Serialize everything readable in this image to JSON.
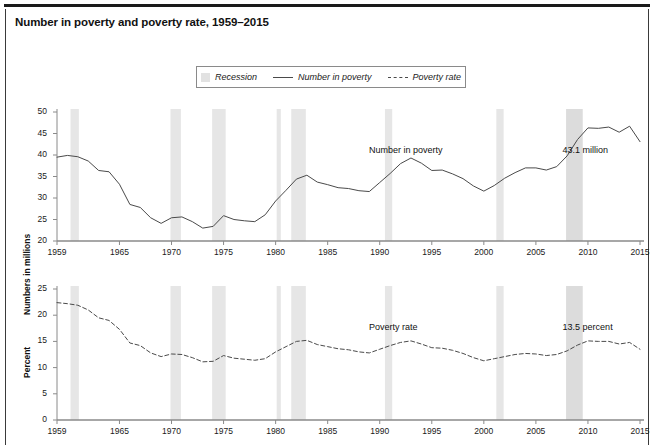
{
  "title": "Number in poverty and poverty rate, 1959–2015",
  "legend": {
    "position": "top-center",
    "items": [
      {
        "label": "Recession",
        "marker": "recession-swatch-icon"
      },
      {
        "label": "Number in poverty",
        "marker": "solid-line-icon"
      },
      {
        "label": "Poverty rate",
        "marker": "dashed-line-icon"
      }
    ]
  },
  "colors": {
    "line": "#4a4a4a",
    "recession_band": "#e6e6e6",
    "recession_band_dark": "#dcdcdc",
    "axis": "#8a8a8a",
    "text": "#111111",
    "frame": "#3a3a3a"
  },
  "recessions": [
    {
      "start": 1960.3,
      "end": 1961.1
    },
    {
      "start": 1969.9,
      "end": 1970.9
    },
    {
      "start": 1973.9,
      "end": 1975.2
    },
    {
      "start": 1980.1,
      "end": 1980.5
    },
    {
      "start": 1981.5,
      "end": 1982.9
    },
    {
      "start": 1990.5,
      "end": 1991.2
    },
    {
      "start": 2001.2,
      "end": 2001.9
    },
    {
      "start": 2007.9,
      "end": 2009.5
    }
  ],
  "chart_data": [
    {
      "type": "line",
      "id": "number-in-poverty",
      "title": "Number in poverty",
      "xlabel": "",
      "ylabel": "Numbers in millions",
      "ylim": [
        20,
        50
      ],
      "yticks": [
        20,
        25,
        30,
        35,
        40,
        45,
        50
      ],
      "xlim": [
        1959,
        2015
      ],
      "xticks": [
        1959,
        1965,
        1970,
        1975,
        1980,
        1985,
        1990,
        1995,
        2000,
        2005,
        2010,
        2015
      ],
      "grid": false,
      "linestyle": "solid",
      "annotations": [
        {
          "text": "Number in poverty",
          "x": 1993.0,
          "y": 41.0
        },
        {
          "text": "43.1 million",
          "x": 2011.6,
          "y": 41.0
        }
      ],
      "x": [
        1959,
        1960,
        1961,
        1962,
        1963,
        1964,
        1965,
        1966,
        1967,
        1968,
        1969,
        1970,
        1971,
        1972,
        1973,
        1974,
        1975,
        1976,
        1977,
        1978,
        1979,
        1980,
        1981,
        1982,
        1983,
        1984,
        1985,
        1986,
        1987,
        1988,
        1989,
        1990,
        1991,
        1992,
        1993,
        1994,
        1995,
        1996,
        1997,
        1998,
        1999,
        2000,
        2001,
        2002,
        2003,
        2004,
        2005,
        2006,
        2007,
        2008,
        2009,
        2010,
        2011,
        2012,
        2013,
        2014,
        2015
      ],
      "values": [
        39.5,
        39.9,
        39.6,
        38.6,
        36.4,
        36.1,
        33.2,
        28.5,
        27.8,
        25.4,
        24.1,
        25.4,
        25.6,
        24.5,
        23.0,
        23.4,
        25.9,
        25.0,
        24.7,
        24.5,
        26.1,
        29.3,
        31.8,
        34.4,
        35.3,
        33.7,
        33.1,
        32.4,
        32.2,
        31.7,
        31.5,
        33.6,
        35.7,
        38.0,
        39.3,
        38.1,
        36.4,
        36.5,
        35.6,
        34.5,
        32.8,
        31.6,
        32.9,
        34.6,
        35.9,
        37.0,
        37.0,
        36.5,
        37.3,
        39.8,
        43.6,
        46.3,
        46.2,
        46.5,
        45.3,
        46.7,
        43.1
      ]
    },
    {
      "type": "line",
      "id": "poverty-rate",
      "title": "Poverty rate",
      "xlabel": "",
      "ylabel": "Percent",
      "ylim": [
        0,
        25
      ],
      "yticks": [
        0,
        5,
        10,
        15,
        20,
        25
      ],
      "xlim": [
        1959,
        2015
      ],
      "xticks": [
        1959,
        1965,
        1970,
        1975,
        1980,
        1985,
        1990,
        1995,
        2000,
        2005,
        2010,
        2015
      ],
      "grid": false,
      "linestyle": "dashed",
      "annotations": [
        {
          "text": "Poverty rate",
          "x": 1993.0,
          "y": 17.6
        },
        {
          "text": "13.5 percent",
          "x": 2011.6,
          "y": 17.6
        }
      ],
      "x": [
        1959,
        1960,
        1961,
        1962,
        1963,
        1964,
        1965,
        1966,
        1967,
        1968,
        1969,
        1970,
        1971,
        1972,
        1973,
        1974,
        1975,
        1976,
        1977,
        1978,
        1979,
        1980,
        1981,
        1982,
        1983,
        1984,
        1985,
        1986,
        1987,
        1988,
        1989,
        1990,
        1991,
        1992,
        1993,
        1994,
        1995,
        1996,
        1997,
        1998,
        1999,
        2000,
        2001,
        2002,
        2003,
        2004,
        2005,
        2006,
        2007,
        2008,
        2009,
        2010,
        2011,
        2012,
        2013,
        2014,
        2015
      ],
      "values": [
        22.4,
        22.2,
        21.9,
        21.0,
        19.5,
        19.0,
        17.3,
        14.7,
        14.2,
        12.8,
        12.1,
        12.6,
        12.5,
        11.9,
        11.1,
        11.2,
        12.3,
        11.8,
        11.6,
        11.4,
        11.7,
        13.0,
        14.0,
        15.0,
        15.2,
        14.4,
        14.0,
        13.6,
        13.4,
        13.0,
        12.8,
        13.5,
        14.2,
        14.8,
        15.1,
        14.5,
        13.8,
        13.7,
        13.3,
        12.7,
        11.9,
        11.3,
        11.7,
        12.1,
        12.5,
        12.7,
        12.6,
        12.3,
        12.5,
        13.2,
        14.3,
        15.1,
        15.0,
        15.0,
        14.5,
        14.8,
        13.5
      ]
    }
  ]
}
